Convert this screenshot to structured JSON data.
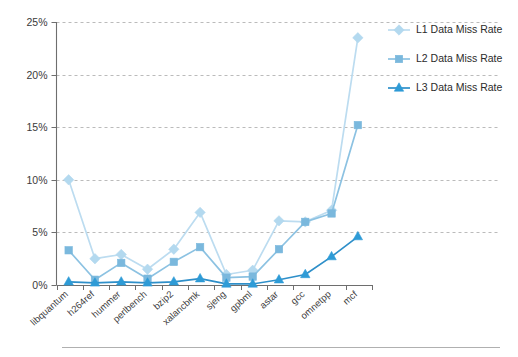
{
  "chart_data": {
    "type": "line",
    "title": "",
    "xlabel": "",
    "ylabel": "",
    "ylim": [
      0,
      25
    ],
    "ytick_labels": [
      "0%",
      "5%",
      "10%",
      "15%",
      "20%",
      "25%"
    ],
    "ytick_values": [
      0,
      5,
      10,
      15,
      20,
      25
    ],
    "grid": true,
    "legend_position": "right",
    "categories": [
      "libquantum",
      "h264ref",
      "hummer",
      "perlbench",
      "bzip2",
      "xalancbmk",
      "sjeng",
      "gpbml",
      "astar",
      "gcc",
      "omnetpp",
      "mcf"
    ],
    "series": [
      {
        "name": "L1 Data Miss Rate",
        "marker": "diamond",
        "color": "#b3d9ef",
        "line_color": "#bcdcf0",
        "values": [
          10.0,
          2.5,
          2.9,
          1.5,
          3.4,
          6.9,
          1.0,
          1.4,
          6.1,
          6.0,
          7.1,
          23.5
        ]
      },
      {
        "name": "L2 Data Miss Rate",
        "marker": "square",
        "color": "#7ab8dd",
        "line_color": "#8cc2e2",
        "values": [
          3.3,
          0.5,
          2.1,
          0.6,
          2.2,
          3.6,
          0.7,
          0.8,
          3.4,
          6.0,
          6.8,
          15.2
        ]
      },
      {
        "name": "L3 Data Miss Rate",
        "marker": "triangle",
        "color": "#2e9bd6",
        "line_color": "#2e8fc9",
        "values": [
          0.3,
          0.2,
          0.3,
          0.2,
          0.3,
          0.6,
          0.1,
          0.1,
          0.5,
          1.0,
          2.7,
          4.6
        ]
      }
    ]
  },
  "legend": {
    "items": [
      {
        "label": "L1 Data Miss Rate"
      },
      {
        "label": "L2 Data Miss Rate"
      },
      {
        "label": "L3 Data Miss Rate"
      }
    ]
  }
}
